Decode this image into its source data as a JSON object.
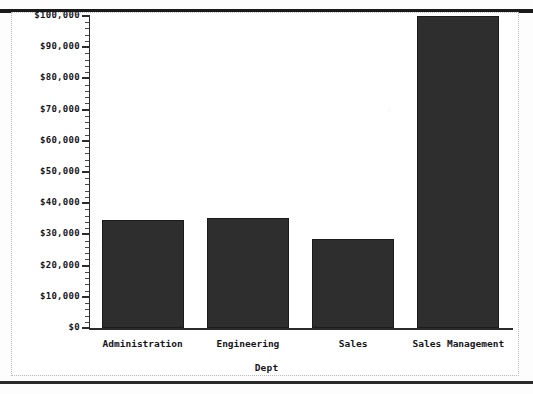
{
  "chart_data": {
    "type": "bar",
    "title": "",
    "subtitle": "",
    "xlabel": "Dept",
    "ylabel": "",
    "categories": [
      "Administration",
      "Engineering",
      "Sales",
      "Sales Management"
    ],
    "values": [
      34700,
      35400,
      28600,
      100000
    ],
    "value_notes": [
      "bar top just below $35,000",
      "bar top just above $35,000",
      "bar top just below $29,000",
      "bar is clipped at the top of the plot area at $100,000 or above"
    ],
    "ylim": [
      0,
      100000
    ],
    "y_ticks": [
      0,
      10000,
      20000,
      30000,
      40000,
      50000,
      60000,
      70000,
      80000,
      90000,
      100000
    ],
    "y_tick_labels": [
      "$0",
      "$10,000",
      "$20,000",
      "$30,000",
      "$40,000",
      "$50,000",
      "$60,000",
      "$70,000",
      "$80,000",
      "$90,000",
      "$100,000"
    ],
    "minor_ticks_per_interval": 4,
    "grid": false,
    "legend": false,
    "legend_position": "none",
    "orientation": "vertical",
    "bar_color": "#2e2e2e",
    "axis_color": "#2b2b2b",
    "background_color": "#ffffff",
    "frame_color": "#b9b9b9"
  },
  "colors": {
    "bar": "#2e2e2e",
    "axis": "#2b2b2b",
    "text": "#16161a",
    "frame": "#b9b9b9",
    "scan_rule": "#1a1a1a",
    "background": "#ffffff"
  }
}
